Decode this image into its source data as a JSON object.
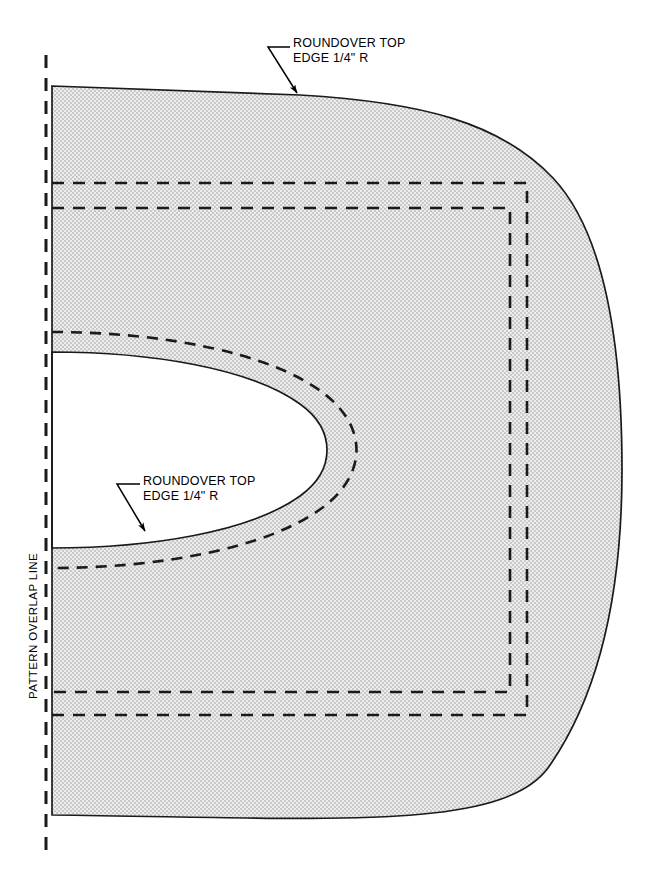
{
  "drawing": {
    "title": "Seat Pattern Half-Plan",
    "canvas": {
      "width": 653,
      "height": 893
    },
    "colors": {
      "outline": "#1a1a1a",
      "fill_light": "#e2e2e2",
      "fill_dark": "#c4c4c4",
      "dashed": "#1a1a1a",
      "background": "#ffffff"
    },
    "annotations": [
      {
        "id": "roundover-top",
        "line1": "ROUNDOVER TOP",
        "line2": "EDGE 1/4\" R",
        "text": "ROUNDOVER TOP\nEDGE 1/4\" R"
      },
      {
        "id": "roundover-slot",
        "line1": "ROUNDOVER TOP",
        "line2": "EDGE 1/4\" R",
        "text": "ROUNDOVER TOP\nEDGE 1/4\" R"
      }
    ],
    "pattern_overlap_label": "PATTERN OVERLAP LINE",
    "notes": {
      "fill_style": "stipple-checkerboard",
      "dash_pattern": "12 9",
      "inner_dash_pattern": "11 8"
    }
  }
}
